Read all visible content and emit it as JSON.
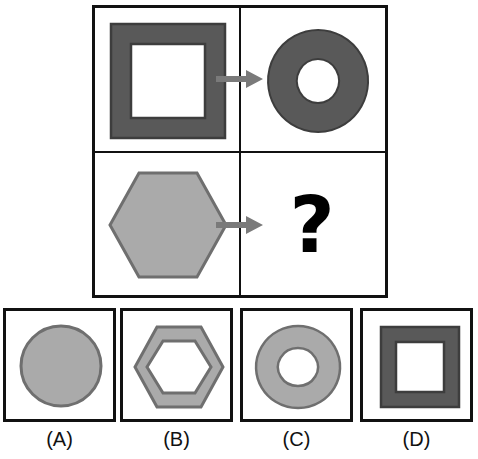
{
  "puzzle": {
    "type": "visual-analogy-matrix",
    "title": "",
    "question_mark": "?",
    "colors": {
      "dark_gray": "#595959",
      "light_gray": "#aaaaaa",
      "outline_dark": "#4a4a4a",
      "outline_light": "#7d7d7d",
      "arrow_gray": "#7a7a7a",
      "frame_black": "#111111",
      "background_white": "#ffffff"
    },
    "matrix": {
      "rows": [
        {
          "name": "row-1",
          "source": {
            "name": "square-ring",
            "shape": "square",
            "fill": "hollow-ring",
            "color": "#595959",
            "description": "thick dark gray square outline with white center"
          },
          "arrow": "arrow-right-icon",
          "result": {
            "name": "circle-ring",
            "shape": "circle",
            "fill": "hollow-ring",
            "color": "#595959",
            "description": "dark gray annulus (donut) with white center"
          }
        },
        {
          "name": "row-2",
          "source": {
            "name": "hexagon-solid",
            "shape": "hexagon",
            "fill": "solid",
            "color": "#aaaaaa",
            "description": "solid light gray hexagon"
          },
          "arrow": "arrow-right-icon",
          "result": {
            "name": "unknown",
            "shape": "?",
            "fill": "?",
            "color": "",
            "description": "question mark placeholder"
          }
        }
      ]
    },
    "options": [
      {
        "id": "A",
        "label": "(A)",
        "name": "option-a",
        "shape": "circle",
        "fill": "solid",
        "color": "#aaaaaa",
        "description": "solid light gray circle"
      },
      {
        "id": "B",
        "label": "(B)",
        "name": "option-b",
        "shape": "hexagon",
        "fill": "hollow-ring",
        "color": "#aaaaaa",
        "description": "light gray hexagonal ring with white center"
      },
      {
        "id": "C",
        "label": "(C)",
        "name": "option-c",
        "shape": "circle",
        "fill": "hollow-ring",
        "color": "#aaaaaa",
        "description": "light gray annulus with white center"
      },
      {
        "id": "D",
        "label": "(D)",
        "name": "option-d",
        "shape": "square",
        "fill": "hollow-ring",
        "color": "#595959",
        "description": "thick dark gray square outline with white center"
      }
    ]
  }
}
